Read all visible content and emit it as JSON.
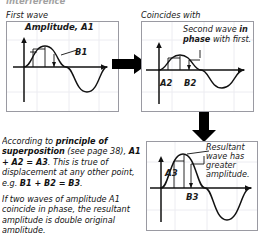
{
  "header": {
    "clipped_line": "interference"
  },
  "panels": {
    "first": {
      "caption": "First wave",
      "annotations": {
        "amplitude_label": "Amplitude, A1",
        "point_label": "B1"
      }
    },
    "second": {
      "caption": "Coincides with",
      "annotations": {
        "note_line1_a": "Second wave ",
        "note_line1_b": "in",
        "note_line2_a": "phase",
        "note_line2_b": " with first.",
        "amplitude_label": "A2",
        "point_label": "B2"
      }
    },
    "resultant": {
      "annotations": {
        "note_line1": "Resultant",
        "note_line2": "wave has",
        "note_line3": "greater",
        "note_line4": "amplitude.",
        "amplitude_label": "A3",
        "point_label": "B3"
      }
    }
  },
  "prose": {
    "paragraph1": {
      "t1": "According to ",
      "b1": "principle of superposition",
      "t2": " (see page 38), ",
      "b2": "A1 + A2 = A3",
      "t3": ". This is true of displacement at any other point, e.g. ",
      "b3": "B1 + B2 = B3",
      "t4": "."
    },
    "paragraph2": "If two waves of amplitude A1 coincide in phase, the resultant amplitude is double original amplitude."
  },
  "arrows": {
    "right_arrow_name": "right-block-arrow",
    "down_arrow_name": "down-block-arrow"
  },
  "colors": {
    "panel_border": "#9a9aa2",
    "wave_stroke": "#111111",
    "axis_stroke": "#111111",
    "arrow_fill": "#000000",
    "grid": "#e9e9ee"
  }
}
